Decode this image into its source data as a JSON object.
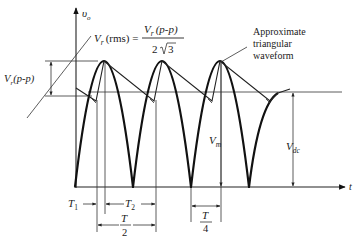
{
  "figure": {
    "type": "full-wave rectifier output with capacitor filter ripple",
    "axes": {
      "y_label": "υ",
      "y_label_sub": "o",
      "x_label": "t"
    },
    "formula": {
      "lhs_symbol": "V",
      "lhs_sub": "r",
      "lhs_paren": "(rms) =",
      "numerator_symbol": "V",
      "numerator_sub": "r",
      "numerator_paren": "(p-p)",
      "denominator": "2",
      "denominator_sqrt": "3"
    },
    "annotation": {
      "lines": [
        "Approximate",
        "triangular",
        "waveform"
      ]
    },
    "labels": {
      "vr_pp_symbol": "V",
      "vr_pp_sub": "r",
      "vr_pp_paren": "(p-p)",
      "vm_symbol": "V",
      "vm_sub": "m",
      "vdc_symbol": "V",
      "vdc_sub": "dc",
      "t1_symbol": "T",
      "t1_sub": "1",
      "t2_symbol": "T",
      "t2_sub": "2",
      "half_period_num": "T",
      "half_period_den": "2",
      "quarter_period_num": "T",
      "quarter_period_den": "4"
    },
    "colors": {
      "ink": "#111111",
      "background": "#ffffff"
    }
  }
}
